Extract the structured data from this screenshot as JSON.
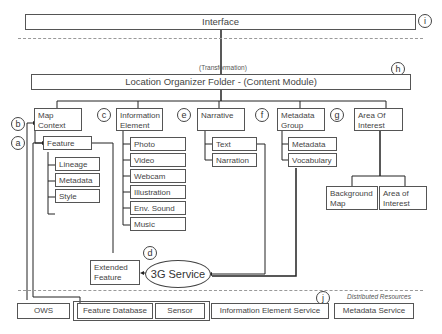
{
  "interface": {
    "label": "Interface",
    "marker": "i"
  },
  "transformation_label": "(Transformation)",
  "content_module": {
    "label": "Location Organizer Folder - (Content Module)",
    "marker": "h"
  },
  "modules": {
    "map_context": {
      "label": "Map Context",
      "marker": "b",
      "feature": {
        "label": "Feature",
        "marker": "a",
        "children": [
          "Lineage",
          "Metadata",
          "Style"
        ]
      }
    },
    "information_element": {
      "label": "Information Element",
      "marker": "c",
      "children": [
        "Photo",
        "Video",
        "Webcam",
        "Illustration",
        "Env. Sound",
        "Music"
      ]
    },
    "narrative": {
      "label": "Narrative",
      "marker": "e",
      "children": [
        "Text",
        "Narration"
      ]
    },
    "metadata_group": {
      "label": "Metadata Group",
      "marker": "f",
      "children": [
        "Metadata",
        "Vocabulary"
      ]
    },
    "area_of_interest": {
      "label": "Area Of Interest",
      "marker": "g",
      "children": [
        "Background Map",
        "Area of Interest"
      ]
    }
  },
  "extended_feature": {
    "label": "Extended Feature"
  },
  "service_3g": {
    "label": "3G Service",
    "marker": "d"
  },
  "distributed": {
    "label": "Distributed Resources",
    "marker": "j",
    "resources": [
      "OWS",
      "Feature Database",
      "Sensor",
      "Information Element Service",
      "Metadata Service"
    ]
  }
}
